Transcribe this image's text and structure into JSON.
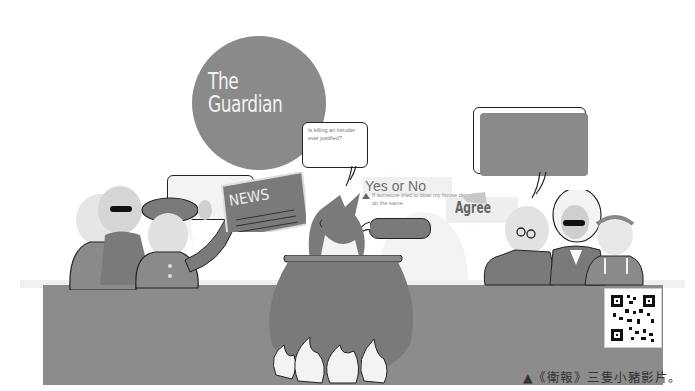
{
  "illustration": {
    "logo_text": "The\nGuardian",
    "question_bubble": "Is killing an intruder ever justified?",
    "yes_or_no": "Yes or No",
    "agree": "Agree",
    "quote": "If someone tried to blow my house down,I'd do the same.",
    "newspaper_label": "NEWS"
  },
  "caption": "▲《衛報》三隻小豬影片。",
  "colors": {
    "background": "#ffffff",
    "mid_gray": "#8a8a8a",
    "dark_gray": "#6e6e6e",
    "outline": "#222222"
  }
}
